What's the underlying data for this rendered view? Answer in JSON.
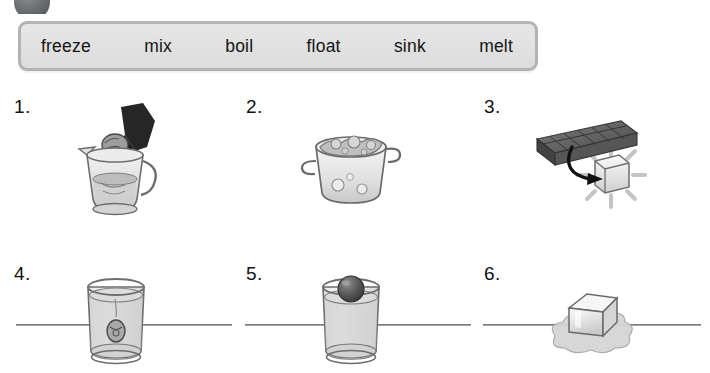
{
  "worksheet": {
    "badge": {
      "name": "exercise-badge",
      "visible_fragment": true
    },
    "word_bank": {
      "words": [
        {
          "id": "freeze",
          "label": "freeze"
        },
        {
          "id": "mix",
          "label": "mix"
        },
        {
          "id": "boil",
          "label": "boil"
        },
        {
          "id": "float",
          "label": "float"
        },
        {
          "id": "sink",
          "label": "sink"
        },
        {
          "id": "melt",
          "label": "melt"
        }
      ],
      "fill_color": "#e1e1e1",
      "border_color": "#b3b3b3"
    },
    "items": [
      {
        "number": "1.",
        "icon": "hand-stirring-pitcher-icon",
        "description": "A hand holding a spoon stirring liquid in a glass pitcher"
      },
      {
        "number": "2.",
        "icon": "boiling-pot-icon",
        "description": "A pot of water with bubbles boiling"
      },
      {
        "number": "3.",
        "icon": "ice-cube-tray-icon",
        "description": "An ice cube tray with an arrow pointing to a single ice cube"
      },
      {
        "number": "4.",
        "icon": "object-sinking-in-glass-icon",
        "description": "A glass of water with an object resting at the bottom"
      },
      {
        "number": "5.",
        "icon": "ball-floating-in-glass-icon",
        "description": "A glass of water with a dark ball floating at the surface"
      },
      {
        "number": "6.",
        "icon": "melting-ice-cube-icon",
        "description": "An ice cube melting into a puddle of water"
      }
    ],
    "dividers": {
      "count": 3
    }
  }
}
